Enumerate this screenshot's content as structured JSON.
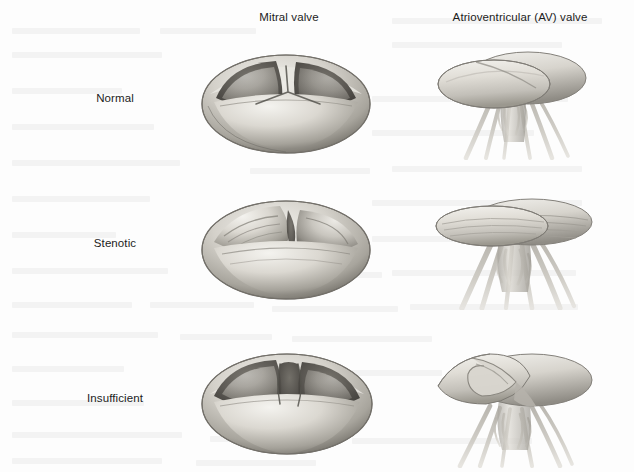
{
  "figure": {
    "background_color": "#fdfdfd",
    "text_color": "#1c1c1c",
    "style": "grayscale medical illustration, 3 rows x 2 columns"
  },
  "columns": [
    {
      "key": "mitral",
      "label": "Mitral valve"
    },
    {
      "key": "av",
      "label": "Atrioventricular (AV) valve"
    }
  ],
  "rows": [
    {
      "key": "normal",
      "label": "Normal"
    },
    {
      "key": "stenotic",
      "label": "Stenotic"
    },
    {
      "key": "insufficient",
      "label": "Insufficient"
    }
  ],
  "illustrations": [
    {
      "name": "mitral-valve-normal",
      "row": "Normal",
      "column": "Mitral valve",
      "view": "superior / en-face",
      "description": "Tri-leaflet cup-shaped valve with three smooth full leaflets meeting centrally; commissures form a narrow Y-shaped closure line."
    },
    {
      "name": "av-valve-normal",
      "row": "Normal",
      "column": "Atrioventricular (AV) valve",
      "view": "lateral / side",
      "description": "Two broad overlapping leaflet discs supported by slender branching chordae tendineae descending to papillary muscles."
    },
    {
      "name": "mitral-valve-stenotic",
      "row": "Stenotic",
      "column": "Mitral valve",
      "view": "superior / en-face",
      "description": "Leaflets thickened, fibrosed and fused at the commissures, producing a narrowed slit-like orifice."
    },
    {
      "name": "av-valve-stenotic",
      "row": "Stenotic",
      "column": "Atrioventricular (AV) valve",
      "view": "lateral / side",
      "description": "Flattened rigid leaflets with ridged fibrotic striations; chordae shortened, thickened and matted together."
    },
    {
      "name": "mitral-valve-insufficient",
      "row": "Insufficient",
      "column": "Mitral valve",
      "view": "superior / en-face",
      "description": "Leaflets fail to coapt, leaving a persistent central gap between the cusps that permits regurgitation."
    },
    {
      "name": "av-valve-insufficient",
      "row": "Insufficient",
      "column": "Atrioventricular (AV) valve",
      "view": "lateral / side",
      "description": "Leaflet edges curl and prolapse back toward the atrium with elongated chordae, so the cusps no longer seal."
    }
  ],
  "palette": {
    "tissue_highlight": "#efeeea",
    "tissue_light": "#dedcd6",
    "tissue_mid": "#b9b6ae",
    "tissue_shadow": "#8a877f",
    "tissue_deep": "#5a5852",
    "cavity_dark": "#46443f",
    "chordae": "#c9c6bf",
    "outline": "#6f6c65"
  }
}
